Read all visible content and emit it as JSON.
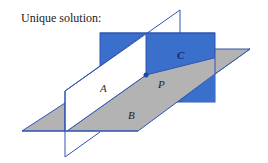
{
  "title": "Unique solution:",
  "labels": {
    "A": "A",
    "B": "B",
    "C": "C",
    "P": "P"
  },
  "colors": {
    "plane_c": "#3b6fcc",
    "plane_b": "#b3b3b3",
    "edge": "#2f55b0",
    "point": "#1d47a8"
  }
}
